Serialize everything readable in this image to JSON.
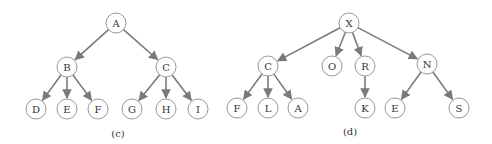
{
  "diagrams": [
    {
      "caption": "(c)",
      "caption_pos": [
        118,
        133
      ],
      "nodes": [
        {
          "id": "A",
          "label": "A",
          "x": 116,
          "y": 23
        },
        {
          "id": "B",
          "label": "B",
          "x": 67,
          "y": 67
        },
        {
          "id": "C",
          "label": "C",
          "x": 166,
          "y": 67
        },
        {
          "id": "D",
          "label": "D",
          "x": 36,
          "y": 109
        },
        {
          "id": "E",
          "label": "E",
          "x": 67,
          "y": 109
        },
        {
          "id": "F",
          "label": "F",
          "x": 98,
          "y": 109
        },
        {
          "id": "G",
          "label": "G",
          "x": 132,
          "y": 109
        },
        {
          "id": "H",
          "label": "H",
          "x": 166,
          "y": 109
        },
        {
          "id": "I",
          "label": "I",
          "x": 198,
          "y": 109
        }
      ],
      "edges": [
        [
          "A",
          "B"
        ],
        [
          "A",
          "C"
        ],
        [
          "B",
          "D"
        ],
        [
          "B",
          "E"
        ],
        [
          "B",
          "F"
        ],
        [
          "C",
          "G"
        ],
        [
          "C",
          "H"
        ],
        [
          "C",
          "I"
        ]
      ]
    },
    {
      "caption": "(d)",
      "caption_pos": [
        350,
        131
      ],
      "nodes": [
        {
          "id": "X",
          "label": "X",
          "x": 349,
          "y": 23
        },
        {
          "id": "C2",
          "label": "C",
          "x": 268,
          "y": 66
        },
        {
          "id": "O",
          "label": "O",
          "x": 332,
          "y": 66
        },
        {
          "id": "R",
          "label": "R",
          "x": 365,
          "y": 66
        },
        {
          "id": "N",
          "label": "N",
          "x": 427,
          "y": 64
        },
        {
          "id": "F2",
          "label": "F",
          "x": 237,
          "y": 108
        },
        {
          "id": "L",
          "label": "L",
          "x": 268,
          "y": 108
        },
        {
          "id": "A2",
          "label": "A",
          "x": 298,
          "y": 108
        },
        {
          "id": "K",
          "label": "K",
          "x": 365,
          "y": 108
        },
        {
          "id": "E2",
          "label": "E",
          "x": 395,
          "y": 108
        },
        {
          "id": "S",
          "label": "S",
          "x": 459,
          "y": 108
        }
      ],
      "edges": [
        [
          "X",
          "C2"
        ],
        [
          "X",
          "O"
        ],
        [
          "X",
          "R"
        ],
        [
          "X",
          "N"
        ],
        [
          "C2",
          "F2"
        ],
        [
          "C2",
          "L"
        ],
        [
          "C2",
          "A2"
        ],
        [
          "R",
          "K"
        ],
        [
          "N",
          "E2"
        ],
        [
          "N",
          "S"
        ]
      ]
    }
  ],
  "style": {
    "edge_color": "#7a7a7a",
    "node_stroke": "#9a9a9a",
    "node_radius": 10
  }
}
